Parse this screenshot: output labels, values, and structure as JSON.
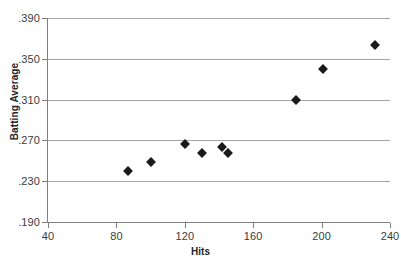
{
  "chart_data": {
    "type": "scatter",
    "title": "",
    "xlabel": "Hits",
    "ylabel": "Batting Average",
    "xlim": [
      40,
      240
    ],
    "ylim": [
      0.19,
      0.39
    ],
    "xticks": [
      40,
      80,
      120,
      160,
      200,
      240
    ],
    "xtick_labels": [
      "40",
      "80",
      "120",
      "160",
      "200",
      "240"
    ],
    "yticks": [
      0.19,
      0.23,
      0.27,
      0.31,
      0.35,
      0.39
    ],
    "ytick_labels": [
      ".190",
      ".230",
      ".270",
      ".310",
      ".350",
      ".390"
    ],
    "grid": "horizontal",
    "legend": "none",
    "marker": "diamond",
    "marker_color": "#1a1a1a",
    "gridline_color": "#a6a6a6",
    "axis_color": "#7f7f7f",
    "points": [
      {
        "x": 87,
        "y": 0.24
      },
      {
        "x": 100,
        "y": 0.249
      },
      {
        "x": 120,
        "y": 0.266
      },
      {
        "x": 130,
        "y": 0.258
      },
      {
        "x": 142,
        "y": 0.264
      },
      {
        "x": 145,
        "y": 0.258
      },
      {
        "x": 185,
        "y": 0.31
      },
      {
        "x": 201,
        "y": 0.34
      },
      {
        "x": 231,
        "y": 0.364
      }
    ]
  }
}
